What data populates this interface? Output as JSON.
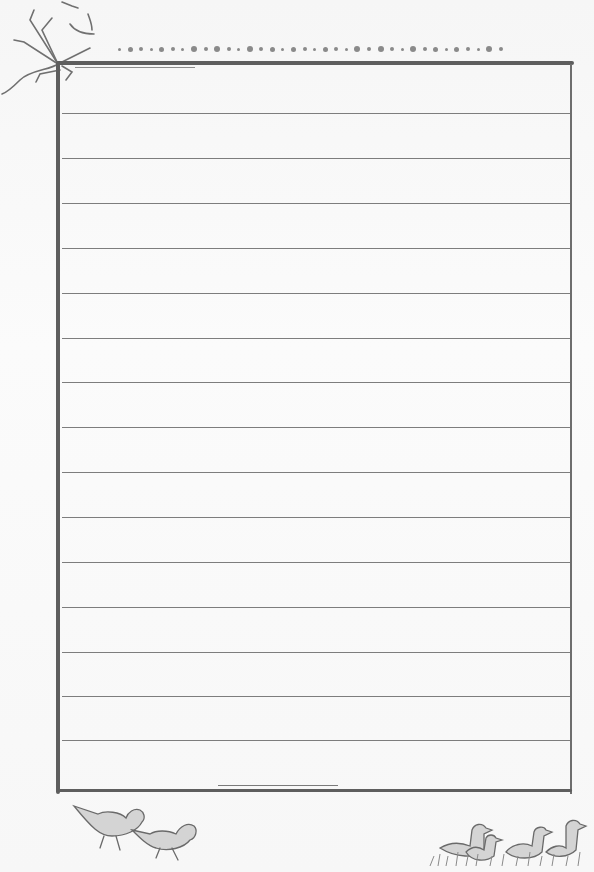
{
  "page": {
    "type": "lined-notepaper",
    "background_color": "#fafafa",
    "ink_color": "#5e5e5e"
  },
  "decorations": {
    "top_left": "bare-tree-branch-sketch",
    "top_border": "row-of-dots",
    "bottom_left": "two-walking-birds-sketch",
    "bottom_right": "group-of-ducklings-in-grass-sketch"
  },
  "frame": {
    "left": 57,
    "top": 62,
    "right": 572,
    "bottom": 792
  },
  "ruled_lines": {
    "count": 15,
    "y_positions": [
      113,
      158,
      203,
      248,
      293,
      338,
      382,
      427,
      472,
      517,
      562,
      607,
      652,
      696,
      740
    ]
  },
  "dots": {
    "count": 36,
    "sizes": [
      3,
      5,
      4,
      3,
      5,
      4,
      3,
      6,
      4,
      6,
      4,
      3,
      6,
      4,
      5,
      3,
      5,
      4,
      3,
      5,
      4,
      3,
      6,
      4,
      6,
      4,
      3,
      6,
      4,
      5,
      3,
      5,
      4,
      3,
      6,
      4
    ]
  }
}
